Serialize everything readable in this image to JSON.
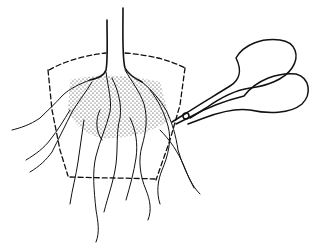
{
  "illustration": {
    "subject": "root pruning of a root-bound plant with scissors",
    "colors": {
      "ink": "#111111",
      "background": "#ffffff"
    },
    "elements": [
      "plant-stem",
      "pot-outline-dashed",
      "soil-rootball-stippled",
      "roots",
      "scissors"
    ]
  }
}
